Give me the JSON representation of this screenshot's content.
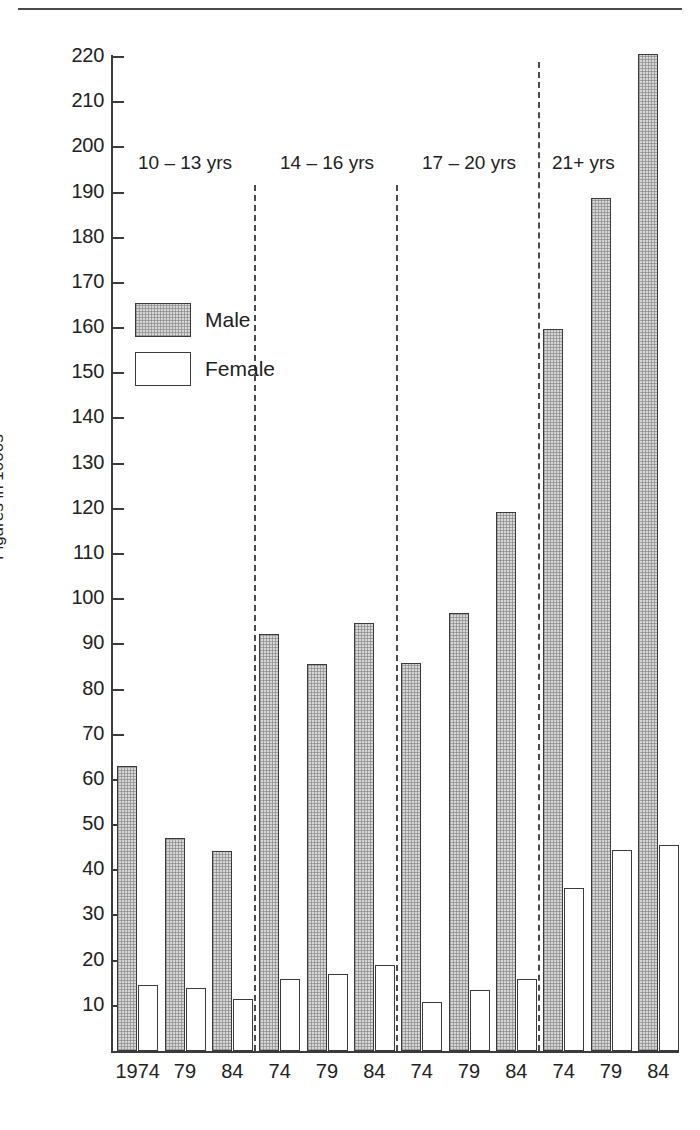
{
  "chart_data": {
    "type": "bar",
    "title": "",
    "xlabel": "",
    "ylabel": "Figures in 1000s",
    "ylim": [
      0,
      220
    ],
    "ytick_step": 10,
    "yticks": [
      10,
      20,
      30,
      40,
      50,
      60,
      70,
      80,
      90,
      100,
      110,
      120,
      130,
      140,
      150,
      160,
      170,
      180,
      190,
      200,
      210,
      220
    ],
    "grid": false,
    "legend": {
      "position": "upper-left-inside",
      "entries": [
        {
          "name": "Male",
          "fill": "stippled-grey",
          "color": "#d6d6d6"
        },
        {
          "name": "Female",
          "fill": "white",
          "color": "#ffffff"
        }
      ]
    },
    "categories": [
      "1974",
      "79",
      "84",
      "74",
      "79",
      "84",
      "74",
      "79",
      "84",
      "74",
      "79",
      "84"
    ],
    "groups": [
      {
        "label": "10 – 13 yrs",
        "categories": [
          "1974",
          "79",
          "84"
        ],
        "male": [
          63,
          47.2,
          44.2
        ],
        "female": [
          14.5,
          13.9,
          11.6
        ]
      },
      {
        "label": "14 – 16 yrs",
        "categories": [
          "74",
          "79",
          "84"
        ],
        "male": [
          92.4,
          85.7,
          94.7
        ],
        "female": [
          15.9,
          17.1,
          19.0
        ]
      },
      {
        "label": "17 – 20 yrs",
        "categories": [
          "74",
          "79",
          "84"
        ],
        "male": [
          85.9,
          96.9,
          119.3
        ],
        "female": [
          10.8,
          13.4,
          16.0
        ]
      },
      {
        "label": "21+ yrs",
        "categories": [
          "74",
          "79",
          "84"
        ],
        "male": [
          159.8,
          188.7,
          220.6
        ],
        "female": [
          36.0,
          44.4,
          45.5
        ]
      }
    ],
    "series": [
      {
        "name": "Male",
        "values": [
          63,
          47.2,
          44.2,
          92.4,
          85.7,
          94.7,
          85.9,
          96.9,
          119.3,
          159.8,
          188.7,
          220.6
        ]
      },
      {
        "name": "Female",
        "values": [
          14.5,
          13.9,
          11.6,
          15.9,
          17.1,
          19.0,
          10.8,
          13.4,
          16.0,
          36.0,
          44.4,
          45.5
        ]
      }
    ],
    "group_labels": [
      "10 – 13 yrs",
      "14 – 16 yrs",
      "17 – 20 yrs",
      "21+ yrs"
    ],
    "xtick_labels": [
      "1974",
      "79",
      "84",
      "74",
      "79",
      "84",
      "74",
      "79",
      "84",
      "74",
      "79",
      "84"
    ]
  }
}
